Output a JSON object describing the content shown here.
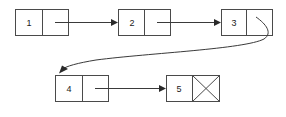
{
  "diagram": {
    "type": "linked-list",
    "canvas": {
      "width": 286,
      "height": 117
    },
    "colors": {
      "background": "#ffffff",
      "box_stroke": "#4a4a4a",
      "line_stroke": "#3a3a3a",
      "arrow_fill": "#2a2a2a",
      "label_fill": "#1a1a1a"
    },
    "nodes": [
      {
        "id": "node-1",
        "label": "1",
        "x": 15,
        "y": 9,
        "width": 53,
        "height": 26,
        "divider_x": 42,
        "pointer": "next",
        "null_terminated": false
      },
      {
        "id": "node-2",
        "label": "2",
        "x": 118,
        "y": 9,
        "width": 52,
        "height": 26,
        "divider_x": 144,
        "pointer": "next",
        "null_terminated": false
      },
      {
        "id": "node-3",
        "label": "3",
        "x": 221,
        "y": 9,
        "width": 51,
        "height": 26,
        "divider_x": 246,
        "pointer": "next",
        "null_terminated": false
      },
      {
        "id": "node-4",
        "label": "4",
        "x": 55,
        "y": 75,
        "width": 53,
        "height": 26,
        "divider_x": 82,
        "pointer": "next",
        "null_terminated": false
      },
      {
        "id": "node-5",
        "label": "5",
        "x": 166,
        "y": 75,
        "width": 53,
        "height": 26,
        "divider_x": 192,
        "pointer": "null",
        "null_terminated": true
      }
    ],
    "links": [
      {
        "id": "link-1-2",
        "from": "node-1",
        "to": "node-2",
        "shape": "straight",
        "path": "M 55 22 L 115 22"
      },
      {
        "id": "link-2-3",
        "from": "node-2",
        "to": "node-3",
        "shape": "straight",
        "path": "M 157 22 L 218 22"
      },
      {
        "id": "link-3-4",
        "from": "node-3",
        "to": "node-4",
        "shape": "curved",
        "path": "M 258 19 C 268 26 272 34 262 40 C 230 54 120 58 62 70"
      },
      {
        "id": "link-4-5",
        "from": "node-4",
        "to": "node-5",
        "shape": "straight",
        "path": "M 95 88 L 163 88"
      }
    ],
    "arrowheads": [
      {
        "id": "arrow-into-2",
        "at": "node-2",
        "x": 118,
        "y": 22,
        "direction": "right"
      },
      {
        "id": "arrow-into-3",
        "at": "node-3",
        "x": 221,
        "y": 22,
        "direction": "right"
      },
      {
        "id": "arrow-into-4",
        "at": "node-4",
        "x": 62,
        "y": 71,
        "direction": "down-left"
      },
      {
        "id": "arrow-into-5",
        "at": "node-5",
        "x": 166,
        "y": 88,
        "direction": "right"
      }
    ]
  }
}
